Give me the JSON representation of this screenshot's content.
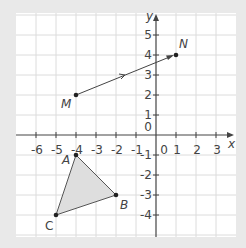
{
  "diagram": {
    "background": "#e9e9e9",
    "panel_color": "#ffffff",
    "grid_color": "#dcdcdc",
    "axis_color": "#444444",
    "shade_color": "#dedede",
    "axes": {
      "x_label": "x",
      "y_label": "y",
      "origin_label": "0"
    },
    "x_ticks": [
      "-6",
      "-5",
      "-4",
      "-3",
      "-2",
      "-1",
      "0",
      "1",
      "2",
      "3"
    ],
    "y_ticks": [
      "5",
      "4",
      "3",
      "2",
      "1",
      "-1",
      "-2",
      "-3",
      "-4"
    ],
    "points": {
      "M": {
        "label": "M",
        "x": -4,
        "y": 2
      },
      "N": {
        "label": "N",
        "x": 1,
        "y": 4
      },
      "A": {
        "label": "A",
        "x": -4,
        "y": -1
      },
      "B": {
        "label": "B",
        "x": -2,
        "y": -3
      },
      "C": {
        "label": "C",
        "x": -5,
        "y": -4
      }
    },
    "vector": {
      "from": "M",
      "to": "N"
    },
    "triangle": [
      "A",
      "B",
      "C"
    ]
  }
}
